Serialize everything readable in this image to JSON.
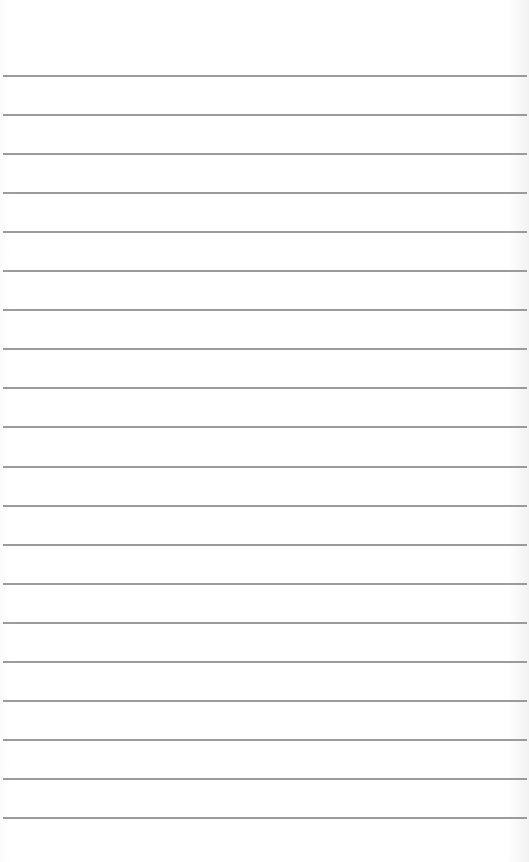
{
  "paper": {
    "type": "lined-paper",
    "background_color": "#ffffff",
    "line_color": "#8a8a8a",
    "first_line_y": 75,
    "line_spacing": 39.05,
    "line_count": 20
  }
}
